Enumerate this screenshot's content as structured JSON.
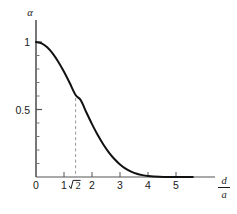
{
  "chart_data": {
    "type": "line",
    "title": "",
    "subtitle": "",
    "xlabel": "d/a",
    "xlabel_numerator": "d",
    "xlabel_denominator": "a",
    "ylabel": "α",
    "xlim": [
      0,
      5.6
    ],
    "ylim": [
      0,
      1.08
    ],
    "grid": false,
    "legend": null,
    "x_ticks": [
      0,
      1,
      2,
      3,
      4,
      5
    ],
    "x_tick_labels": [
      "0",
      "1",
      "2",
      "3",
      "4",
      "5"
    ],
    "y_ticks": [
      0,
      0.5,
      1
    ],
    "y_tick_labels": [
      "0",
      "0.5",
      "1"
    ],
    "y_minor_ticks": [
      0.1,
      0.2,
      0.3,
      0.4,
      0.6,
      0.7,
      0.8,
      0.9
    ],
    "annotations": [
      {
        "name": "sqrt2-marker",
        "type": "vertical-dashed-line",
        "x": 1.41421356,
        "label": "√2",
        "label_radicand": "2",
        "y_from": 0,
        "y_to": 0.585,
        "color": "#999999"
      }
    ],
    "series": [
      {
        "name": "alpha",
        "color": "#111111",
        "linewidth": 2.0,
        "x": [
          0.0,
          0.2,
          0.4,
          0.6,
          0.8,
          1.0,
          1.2,
          1.41421356,
          1.6,
          1.8,
          2.0,
          2.2,
          2.4,
          2.6,
          2.8,
          3.0,
          3.2,
          3.4,
          3.6,
          3.8,
          4.0,
          4.4,
          4.8,
          5.2,
          5.6
        ],
        "values": [
          1.0,
          0.99,
          0.961,
          0.914,
          0.852,
          0.779,
          0.698,
          0.607,
          0.568,
          0.478,
          0.392,
          0.313,
          0.243,
          0.183,
          0.133,
          0.093,
          0.062,
          0.04,
          0.024,
          0.014,
          0.008,
          0.002,
          0.0,
          0.0,
          0.0
        ]
      }
    ]
  }
}
